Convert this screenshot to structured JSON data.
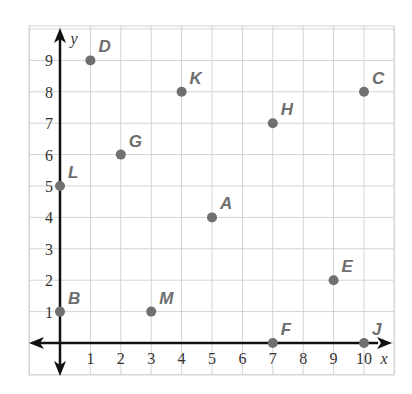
{
  "chart_data": {
    "type": "scatter",
    "title": "",
    "xlabel": "x",
    "ylabel": "y",
    "xlim": [
      0,
      10
    ],
    "ylim": [
      0,
      9
    ],
    "grid": true,
    "x_ticks": [
      1,
      2,
      3,
      4,
      5,
      6,
      7,
      8,
      9,
      10
    ],
    "y_ticks": [
      1,
      2,
      3,
      4,
      5,
      6,
      7,
      8,
      9
    ],
    "points": [
      {
        "label": "A",
        "x": 5,
        "y": 4
      },
      {
        "label": "B",
        "x": 0,
        "y": 1
      },
      {
        "label": "C",
        "x": 10,
        "y": 8
      },
      {
        "label": "D",
        "x": 1,
        "y": 9
      },
      {
        "label": "E",
        "x": 9,
        "y": 2
      },
      {
        "label": "F",
        "x": 7,
        "y": 0
      },
      {
        "label": "G",
        "x": 2,
        "y": 6
      },
      {
        "label": "H",
        "x": 7,
        "y": 7
      },
      {
        "label": "J",
        "x": 10,
        "y": 0
      },
      {
        "label": "K",
        "x": 4,
        "y": 8
      },
      {
        "label": "L",
        "x": 0,
        "y": 5
      },
      {
        "label": "M",
        "x": 3,
        "y": 1
      }
    ],
    "colors": {
      "point": "#707070",
      "label": "#6e6e6e",
      "grid": "#d4d4d4",
      "axis": "#111111"
    }
  }
}
